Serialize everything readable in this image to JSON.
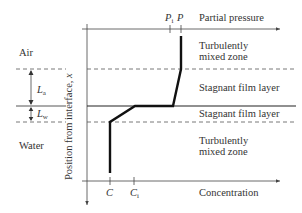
{
  "diagram": {
    "top_axis": {
      "label": "Partial pressure",
      "ticks": [
        {
          "id": "P_i",
          "main": "P",
          "sub": "i"
        },
        {
          "id": "P",
          "main": "P",
          "sub": ""
        }
      ]
    },
    "bottom_axis": {
      "label": "Concentration",
      "ticks": [
        {
          "id": "C",
          "main": "C",
          "sub": ""
        },
        {
          "id": "C_i",
          "main": "C",
          "sub": "i"
        }
      ]
    },
    "vertical_axis": {
      "label": "Position from interface, ",
      "var": "x"
    },
    "phases": {
      "air": "Air",
      "water": "Water"
    },
    "thickness_labels": {
      "air": {
        "main": "L",
        "sub": "a"
      },
      "water": {
        "main": "L",
        "sub": "w"
      }
    },
    "zones": [
      {
        "id": "air-turbulent",
        "line1": "Turbulently",
        "line2": "mixed zone"
      },
      {
        "id": "air-stagnant",
        "line1": "Stagnant film layer"
      },
      {
        "id": "water-stagnant",
        "line1": "Stagnant film layer"
      },
      {
        "id": "water-turbulent",
        "line1": "Turbulently",
        "line2": "mixed zone"
      }
    ],
    "colors": {
      "profile": "#111111",
      "axis": "#444444",
      "dashed": "#555555"
    }
  }
}
